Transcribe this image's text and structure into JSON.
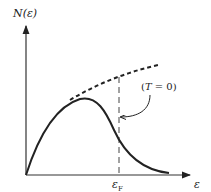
{
  "diagram": {
    "y_axis_label": "N(ε)",
    "x_axis_label": "ε",
    "fermi_label": "ε",
    "fermi_subscript": "F",
    "annotation_open": "(",
    "annotation_var": "T",
    "annotation_rest": " = 0)",
    "colors": {
      "line": "#222222",
      "background": "#ffffff"
    },
    "curves": [
      {
        "name": "finite-temperature distribution",
        "style": "solid"
      },
      {
        "name": "T=0 density of states",
        "style": "dashed"
      },
      {
        "name": "fermi-energy marker",
        "style": "dashed-vertical"
      }
    ]
  }
}
